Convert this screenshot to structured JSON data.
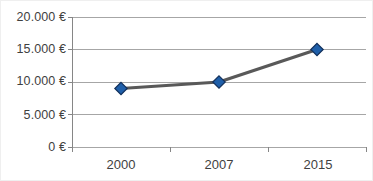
{
  "chart_data": {
    "type": "line",
    "title": "",
    "subtitle": "",
    "xlabel": "",
    "ylabel": "",
    "categories": [
      "2000",
      "2007",
      "2015"
    ],
    "series": [
      {
        "name": "",
        "values": [
          9000,
          10000,
          15000
        ],
        "line_color": "#595959",
        "marker_color": "#1f5fa9",
        "marker_edge_color": "#13315c",
        "marker": "diamond"
      }
    ],
    "ylim": [
      0,
      20000
    ],
    "yticks": [
      0,
      5000,
      10000,
      15000,
      20000
    ],
    "ytick_labels": [
      "0 €",
      "5.000 €",
      "10.000 €",
      "15.000 €",
      "20.000 €"
    ],
    "xtick_labels": [
      "2000",
      "2007",
      "2015"
    ],
    "grid": true,
    "grid_axis": "y",
    "grid_color": "#a6a6a6",
    "legend": false,
    "legend_position": "none",
    "plot_background": "#ffffff",
    "axis_color": "#868686",
    "tick_label_color": "#3f3f3f",
    "currency": "€",
    "number_format": "de-DE",
    "annotations": []
  },
  "axis": {
    "y_labels": [
      {
        "text": "20.000 €",
        "value": 20000
      },
      {
        "text": "15.000 €",
        "value": 15000
      },
      {
        "text": "10.000 €",
        "value": 10000
      },
      {
        "text": "5.000 €",
        "value": 5000
      },
      {
        "text": "0 €",
        "value": 0
      }
    ],
    "x_labels": [
      {
        "text": "2000"
      },
      {
        "text": "2007"
      },
      {
        "text": "2015"
      }
    ]
  }
}
